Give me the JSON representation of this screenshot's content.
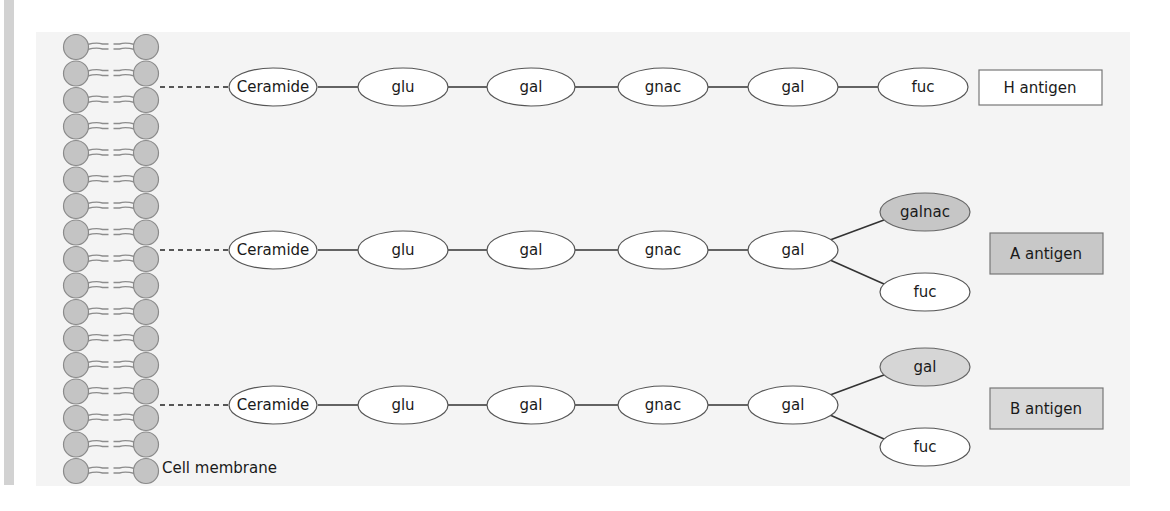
{
  "diagram": {
    "title": "",
    "membrane": {
      "label": "Cell membrane",
      "rows": 17,
      "head_color": "#c4c4c4",
      "head_stroke": "#8a8a8a"
    },
    "chains": [
      {
        "id": "h",
        "backbone": [
          "Ceramide",
          "glu",
          "gal",
          "gnac",
          "gal"
        ],
        "branches": [
          {
            "label": "fuc",
            "fill": "#ffffff"
          }
        ],
        "antigen_label": "H antigen",
        "antigen_fill": "#ffffff"
      },
      {
        "id": "a",
        "backbone": [
          "Ceramide",
          "glu",
          "gal",
          "gnac",
          "gal"
        ],
        "branches": [
          {
            "label": "galnac",
            "fill": "#c6c6c6"
          },
          {
            "label": "fuc",
            "fill": "#ffffff"
          }
        ],
        "antigen_label": "A antigen",
        "antigen_fill": "#c8c8c8"
      },
      {
        "id": "b",
        "backbone": [
          "Ceramide",
          "glu",
          "gal",
          "gnac",
          "gal"
        ],
        "branches": [
          {
            "label": "gal",
            "fill": "#d6d6d6"
          },
          {
            "label": "fuc",
            "fill": "#ffffff"
          }
        ],
        "antigen_label": "B antigen",
        "antigen_fill": "#d9d9d9"
      }
    ]
  }
}
